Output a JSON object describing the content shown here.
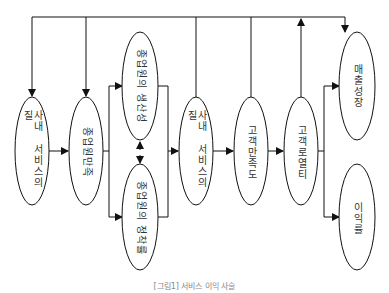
{
  "diagram": {
    "title_caption": "[그림1] 서비스 이익 사슬",
    "nodes": [
      {
        "id": "n1",
        "label": "사내 서비스의 질"
      },
      {
        "id": "n2",
        "label": "종업원만족"
      },
      {
        "id": "n3",
        "label": "종업원의 생산성"
      },
      {
        "id": "n4",
        "label": "종업원의 정착률"
      },
      {
        "id": "n5",
        "label": "사내 서비스의 질"
      },
      {
        "id": "n6",
        "label": "고객만족도"
      },
      {
        "id": "n7",
        "label": "고객로열티"
      },
      {
        "id": "n8",
        "label": "매출성장"
      },
      {
        "id": "n9",
        "label": "이익률"
      }
    ],
    "edges": [
      {
        "from": "n1",
        "to": "n2"
      },
      {
        "from": "n2",
        "to": "n3"
      },
      {
        "from": "n2",
        "to": "n4"
      },
      {
        "from": "n3",
        "to": "n4",
        "bidirectional": true
      },
      {
        "from": "n3",
        "to": "n5"
      },
      {
        "from": "n4",
        "to": "n5"
      },
      {
        "from": "n5",
        "to": "n6"
      },
      {
        "from": "n6",
        "to": "n7"
      },
      {
        "from": "n7",
        "to": "n8"
      },
      {
        "from": "n7",
        "to": "n9"
      },
      {
        "from": "n7",
        "to": "feedback-top-line"
      },
      {
        "from": "feedback-top-line",
        "to": "n1"
      },
      {
        "from": "feedback-top-line",
        "to": "n2"
      },
      {
        "from": "feedback-top-line",
        "to": "n8"
      }
    ]
  }
}
